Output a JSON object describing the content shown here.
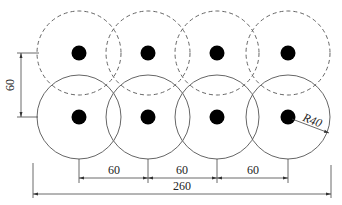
{
  "diagram": {
    "type": "engineering-drawing",
    "colors": {
      "background": "#ffffff",
      "line": "#555555",
      "dot": "#000000",
      "text": "#222222"
    },
    "circles": {
      "radius_label": "R40",
      "top_row": {
        "style": "dashed",
        "count": 4
      },
      "bottom_row": {
        "style": "solid",
        "count": 4
      }
    },
    "dimensions": {
      "vertical_spacing": "60",
      "horizontal_spacing": [
        "60",
        "60",
        "60"
      ],
      "overall_width": "260",
      "radius": "R40"
    }
  }
}
